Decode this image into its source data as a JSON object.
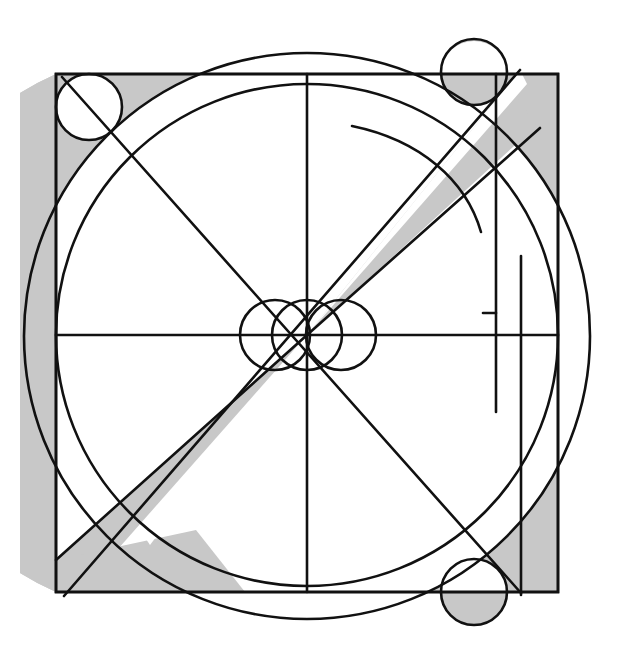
{
  "figure": {
    "title": "Geometric construction diagram",
    "canvas": {
      "width": 618,
      "height": 662
    },
    "colors": {
      "background": "#ffffff",
      "stroke": "#111111",
      "shade": "#c8c8c8",
      "shade_dark": "#b8b8b8"
    },
    "stroke_width": 2.6
  },
  "geometry": {
    "center": {
      "x": 307,
      "y": 335
    },
    "square": {
      "x": 56,
      "y": 74,
      "side": 502
    },
    "outer_circle": {
      "cx": 307,
      "cy": 336,
      "r": 283
    },
    "inner_circle": {
      "cx": 307,
      "cy": 335,
      "r": 251
    },
    "corner_circles": [
      {
        "name": "top-left-circle",
        "cx": 89,
        "cy": 107,
        "r": 33
      },
      {
        "name": "top-right-circle",
        "cx": 474,
        "cy": 72,
        "r": 33
      },
      {
        "name": "bottom-right-circle",
        "cx": 474,
        "cy": 592,
        "r": 33
      }
    ],
    "center_circles": [
      {
        "name": "center-circle-left",
        "cx": 275,
        "cy": 335,
        "r": 35
      },
      {
        "name": "center-circle-middle",
        "cx": 307,
        "cy": 335,
        "r": 35
      },
      {
        "name": "center-circle-right",
        "cx": 341,
        "cy": 335,
        "r": 35
      }
    ],
    "axes": {
      "horizontal_y": 335,
      "vertical_x": 307,
      "horizontal_x1": 56,
      "horizontal_x2": 558,
      "vertical_y1": 74,
      "vertical_y2": 592
    },
    "right_verticals": [
      {
        "name": "inner-right-vertical",
        "x": 496,
        "y1": 74,
        "y2": 412
      },
      {
        "name": "short-right-vertical",
        "x": 521,
        "y1": 256,
        "y2": 595
      }
    ],
    "diagonals": [
      {
        "name": "diagonal-ne-sw",
        "x1": 520,
        "y1": 70,
        "x2": 64,
        "y2": 595
      },
      {
        "name": "diagonal-nw-se",
        "x1": 62,
        "y1": 78,
        "x2": 520,
        "y2": 592
      }
    ],
    "free_arc": {
      "name": "upper-right-free-arc",
      "description": "short unattached arc in upper right quadrant"
    },
    "shaded_regions": [
      {
        "name": "wedge-northeast",
        "fill": "#c8c8c8"
      },
      {
        "name": "wedge-southwest",
        "fill": "#c8c8c8"
      },
      {
        "name": "sliver-left-edge",
        "fill": "#c8c8c8"
      },
      {
        "name": "sliver-top-left-corner",
        "fill": "#c8c8c8"
      },
      {
        "name": "band-right-edge",
        "fill": "#c8c8c8"
      },
      {
        "name": "wedge-bottom-left-corner",
        "fill": "#c8c8c8"
      },
      {
        "name": "top-right-circle-fill",
        "fill": "#c8c8c8"
      },
      {
        "name": "bottom-right-circle-fill",
        "fill": "#c8c8c8"
      }
    ]
  }
}
